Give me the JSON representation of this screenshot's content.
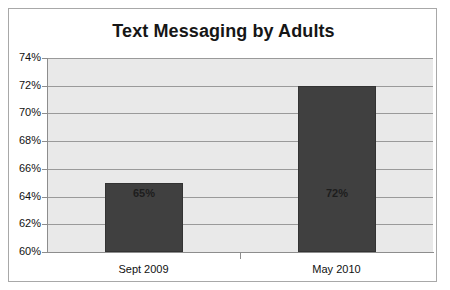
{
  "chart_data": {
    "type": "bar",
    "title": "Text Messaging by Adults",
    "categories": [
      "Sept 2009",
      "May 2010"
    ],
    "values": [
      65,
      72
    ],
    "data_labels": [
      "65%",
      "72%"
    ],
    "xlabel": "",
    "ylabel": "",
    "ylim": [
      60,
      74
    ],
    "ytick_step": 2,
    "ytick_labels": [
      "74%",
      "72%",
      "70%",
      "68%",
      "66%",
      "64%",
      "62%",
      "60%"
    ],
    "ytick_values": [
      74,
      72,
      70,
      68,
      66,
      64,
      62,
      60
    ],
    "grid": true,
    "legend": false,
    "legend_position": "none",
    "colors": {
      "bar": "#404040",
      "bar_border": "#333333",
      "plot_background": "#e9e9e9",
      "gridline": "#9a9a9a",
      "axis": "#8d8d8d",
      "frame_border": "#a8a8a8",
      "title_text": "#161616",
      "tick_text": "#111111",
      "data_label_text": "#1d1d1d"
    }
  }
}
